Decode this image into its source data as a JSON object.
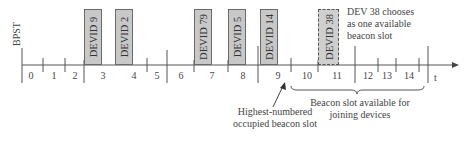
{
  "axis": {
    "start_label": "BPST",
    "end_label": "t",
    "slot_numbers": [
      "0",
      "1",
      "2",
      "3",
      "4",
      "5",
      "6",
      "7",
      "8",
      "9",
      "10",
      "11",
      "12",
      "13",
      "14"
    ]
  },
  "beacon_slots": [
    {
      "label": "DEVID 9",
      "slot": "3",
      "style": "occupied"
    },
    {
      "label": "DEVID 2",
      "slot": "4",
      "style": "occupied"
    },
    {
      "label": "DEVID 79",
      "slot": "7",
      "style": "occupied"
    },
    {
      "label": "DEVID 5",
      "slot": "8",
      "style": "occupied"
    },
    {
      "label": "DEVID 14",
      "slot": "9",
      "style": "occupied"
    },
    {
      "label": "DEVID 38",
      "slot": "11",
      "style": "chosen-dashed"
    }
  ],
  "annotations": {
    "dev38_line1": "DEV 38 chooses",
    "dev38_line2": "as one available",
    "dev38_line3": "beacon slot",
    "highest_line1": "Highest-numbered",
    "highest_line2": "occupied beacon slot",
    "available_line1": "Beacon slot available for",
    "available_line2": "joining devices"
  },
  "colors": {
    "box_fill": "#c8c8c8",
    "line": "#555555",
    "text": "#333333"
  }
}
